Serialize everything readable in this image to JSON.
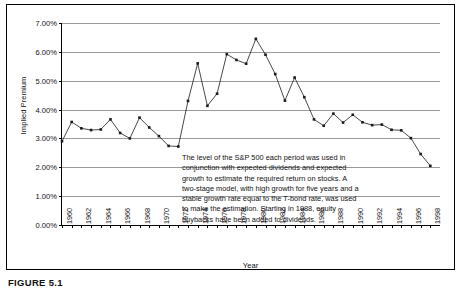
{
  "figure": {
    "caption": "FIGURE 5.1"
  },
  "chart_data": {
    "type": "line",
    "title": "",
    "xlabel": "Year",
    "ylabel": "Implied Premium",
    "xlim": [
      1960,
      1999
    ],
    "ylim": [
      0.0,
      7.0
    ],
    "yticks": [
      "0.00%",
      "1.00%",
      "2.00%",
      "3.00%",
      "4.00%",
      "5.00%",
      "6.00%",
      "7.00%"
    ],
    "ytick_values": [
      0.0,
      1.0,
      2.0,
      3.0,
      4.0,
      5.0,
      6.0,
      7.0
    ],
    "xticks": [
      1960,
      1962,
      1964,
      1966,
      1968,
      1970,
      1972,
      1974,
      1976,
      1978,
      1980,
      1982,
      1984,
      1986,
      1988,
      1990,
      1992,
      1994,
      1996,
      1998
    ],
    "grid": "horizontal",
    "legend": "none",
    "marker": "square",
    "series_name": "Implied Premium",
    "x": [
      1960,
      1961,
      1962,
      1963,
      1964,
      1965,
      1966,
      1967,
      1968,
      1969,
      1970,
      1971,
      1972,
      1973,
      1974,
      1975,
      1976,
      1977,
      1978,
      1979,
      1980,
      1981,
      1982,
      1983,
      1984,
      1985,
      1986,
      1987,
      1988,
      1989,
      1990,
      1991,
      1992,
      1993,
      1994,
      1995,
      1996,
      1997,
      1998
    ],
    "values": [
      2.9,
      3.57,
      3.35,
      3.29,
      3.31,
      3.66,
      3.19,
      3.0,
      3.72,
      3.38,
      3.08,
      2.74,
      2.72,
      4.3,
      5.6,
      4.13,
      4.55,
      5.92,
      5.72,
      5.59,
      6.45,
      5.9,
      5.23,
      4.31,
      5.11,
      4.43,
      3.66,
      3.44,
      3.86,
      3.55,
      3.82,
      3.56,
      3.46,
      3.48,
      3.3,
      3.28,
      3.01,
      2.46,
      2.05
    ],
    "annotation": "The level of the S&P 500 each period was used in\nconjunction with expected dividends and expected\ngrowth to estimate the required return on stocks. A\ntwo-stage model, with high growth for five years and a\nstable growth rate equal to the T-bond rate, was used\nto make the estimation. Starting in 1988, equity\nbuybacks have been added to dividends.",
    "colors": {
      "line": "#1a1a1a",
      "marker": "#1a1a1a",
      "grid": "#9a9a9a",
      "axis": "#000000",
      "background": "#ffffff"
    }
  }
}
